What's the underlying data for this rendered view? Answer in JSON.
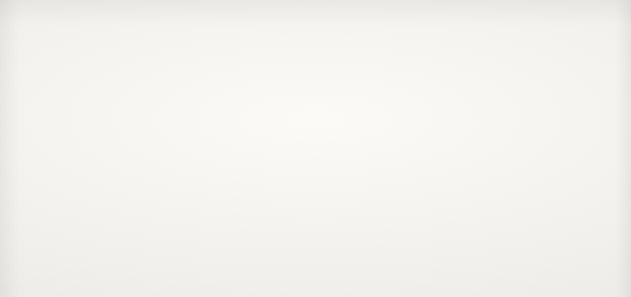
{
  "source_note": "Source: U.S. Census Bureau, 2010 census",
  "title_partial": "census 1870 - 2010",
  "colors": {
    "background": "#f2f1ee",
    "gridline": "#8a8a88",
    "text": "#1b1b1b"
  },
  "chart_data": {
    "type": "bar",
    "orientation": "horizontal",
    "title": "",
    "xlabel": "",
    "ylabel": "",
    "xlim": [
      0,
      900000
    ],
    "grid": true,
    "legend": "none",
    "categories": [
      "1870",
      "1880",
      "1890",
      "1900",
      "1910",
      "1920",
      "1930",
      "1940",
      "1950",
      "1960",
      "1970",
      "1980",
      "1990",
      "2000",
      "2010"
    ],
    "values": [
      9000,
      92000,
      349000,
      400000,
      588000,
      639000,
      690000,
      645000,
      652000,
      682000,
      671000,
      690000,
      699000,
      759000,
      814000
    ],
    "xticks": [
      0,
      100000,
      200000,
      300000,
      400000,
      500000,
      600000,
      700000,
      800000,
      900000
    ],
    "xtick_labels": [
      "0",
      "100,000",
      "200,000",
      "300,000",
      "400,000",
      "500,000",
      "600,000",
      "700,000",
      "800,000",
      "900,000"
    ],
    "bar_colors": [
      "#1c1c1c",
      "#4b4b4b",
      "#555555",
      "#5a5a5a",
      "#8f8f8f",
      "#6f6f6f",
      "#3f3f3f",
      "#474747",
      "#5b5b5b",
      "#a4a4a4",
      "#e4e3e0",
      "#b4b4b4",
      "#9d9d9d",
      "#707070",
      "#1f1f1f"
    ]
  }
}
